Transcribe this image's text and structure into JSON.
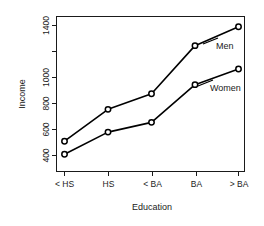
{
  "chart_data": {
    "type": "line",
    "title": "",
    "xlabel": "Education",
    "ylabel": "Income",
    "categories": [
      "< HS",
      "HS",
      "< BA",
      "BA",
      "> BA"
    ],
    "series": [
      {
        "name": "Men",
        "values": [
          510,
          755,
          875,
          1245,
          1390
        ]
      },
      {
        "name": "Women",
        "values": [
          410,
          580,
          655,
          945,
          1065
        ]
      }
    ],
    "ylim": [
      370,
      1420
    ],
    "yticks": [
      400,
      600,
      800,
      1000,
      1200,
      1400
    ],
    "ytick_labels": [
      "400",
      "600",
      "800",
      "1000",
      "",
      "1400"
    ],
    "grid": false,
    "legend": "inline-annotations",
    "marker": "open-circle",
    "line_color": "#000000",
    "background_color": "#ffffff"
  },
  "axes": {
    "y_title": "Income",
    "x_title": "Education",
    "y_labels": {
      "t400": "400",
      "t600": "600",
      "t800": "800",
      "t1000": "1000",
      "t1400": "1400"
    },
    "x_labels": {
      "c0": "< HS",
      "c1": "HS",
      "c2": "< BA",
      "c3": "BA",
      "c4": "> BA"
    }
  },
  "annotations": {
    "men": "Men",
    "women": "Women"
  }
}
